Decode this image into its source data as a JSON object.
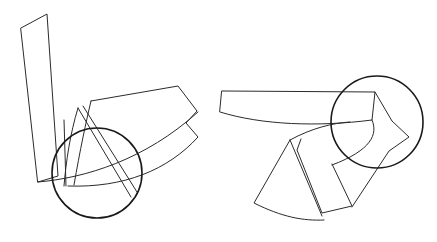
{
  "figure": {
    "canvas": {
      "width": 437,
      "height": 242,
      "background_color": "#ffffff"
    },
    "style": {
      "shape_stroke_color": "#2b2b2b",
      "shape_stroke_width": 1,
      "circle_stroke_color": "#1a1a1a",
      "circle_stroke_width": 1.6,
      "fill": "none"
    },
    "groups": [
      {
        "name": "left-cluster",
        "label": "Left cluster",
        "elements": [
          {
            "name": "left-circle",
            "type": "circle",
            "cx": 97,
            "cy": 173,
            "r": 45
          },
          {
            "name": "left-tall-quadrilateral",
            "type": "polygon",
            "points": "21,28 47,14 58,176 38,182"
          },
          {
            "name": "left-lower-curved-band",
            "type": "path",
            "d": "M 38,182 C 80,172 140,158 198,111"
          },
          {
            "name": "left-fan-wedge",
            "type": "path",
            "d": "M 91,101 L 178,86 L 197,111 L 186,123 L 197,136 C 160,172 120,188 68,186 C 78,150 84,124 91,101 Z"
          },
          {
            "name": "left-inner-peak-shape",
            "type": "path",
            "d": "M 78,108 L 129,196 L 135,192 L 86,106 Z"
          },
          {
            "name": "left-inner-left-edge",
            "type": "path",
            "d": "M 78,108 C 70,135 66,160 64,185"
          },
          {
            "name": "left-inner-vertical-line",
            "type": "path",
            "d": "M 64,120 L 66,186"
          }
        ]
      },
      {
        "name": "right-cluster",
        "label": "Right cluster",
        "elements": [
          {
            "name": "right-circle",
            "type": "circle",
            "cx": 377,
            "cy": 122,
            "r": 46
          },
          {
            "name": "right-long-bar",
            "type": "path",
            "d": "M 222,91 L 375,92 L 372,120 C 320,127 265,126 220,113 Z"
          },
          {
            "name": "right-bar-extension-wedge",
            "type": "path",
            "d": "M 375,92 L 392,121 L 408,137 L 390,150 L 352,206 L 332,164 C 350,148 364,135 372,120 Z"
          },
          {
            "name": "right-lower-left-fan",
            "type": "path",
            "d": "M 290,140 L 254,203 C 283,216 304,220 323,220 C 312,192 300,166 290,140 Z"
          },
          {
            "name": "right-lower-right-fan",
            "type": "path",
            "d": "M 300,139 L 297,150 L 322,213 L 352,206 L 332,164 Z"
          },
          {
            "name": "right-fan-connector-curve",
            "type": "path",
            "d": "M 290,140 C 310,129 330,124 347,122"
          }
        ]
      }
    ]
  }
}
